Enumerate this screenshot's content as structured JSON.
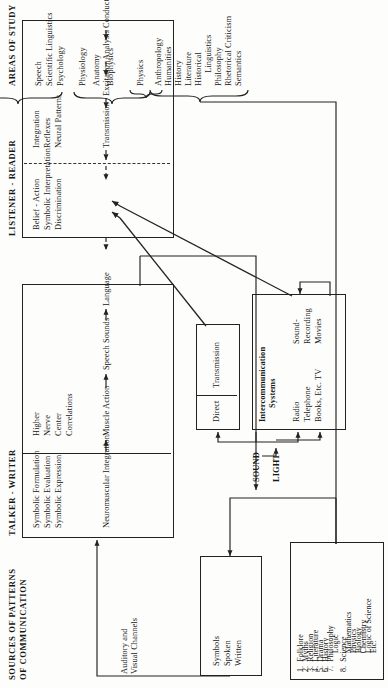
{
  "figure": {
    "sources_title_line1": "SOURCES OF PATTERNS",
    "sources_title_line2": "OF COMMUNICATION",
    "talker_title": "TALKER - WRITER",
    "listener_title": "LISTENER - READER",
    "areas_title": "AREAS OF STUDY"
  },
  "sources": {
    "channels_line1": "Auditory and",
    "channels_line2": "Visual Channels",
    "symbols_box": [
      "Symbols",
      "Spoken",
      "Written"
    ],
    "patterns_list": [
      "1.  Folklore",
      "2.  Myths",
      "3.  Religion",
      "4.  Literature",
      "5.  Drama",
      "6.  History",
      "7.  Philosophy",
      "         Logic",
      "8.  Science",
      "         Mathematics",
      "         Physics",
      "         Biology",
      "         Chemistry",
      "         Logic of Science",
      "         Etc."
    ]
  },
  "talker": {
    "col1": [
      "Symbolic Formulation",
      "Symbolic Evaluation",
      "Symbolic Expression"
    ],
    "col2": [
      "Higher",
      "Nerve",
      "Center",
      "Correlations"
    ],
    "stage1": "Neuromuscular Integration",
    "stage2": "Muscle Action",
    "stage3": "Speech Sounds",
    "stage4": "Language"
  },
  "channels": {
    "sound_label": "SOUND",
    "light_label": "LIGHT",
    "direct_box": [
      "Direct",
      "Transmission"
    ],
    "intercom_title_l1": "Intercommunication",
    "intercom_title_l2": "Systems",
    "intercom_col1": [
      "Radio",
      "Telephone",
      "Books, Etc. TV"
    ],
    "intercom_col2": [
      "Sound-",
      "Recording",
      "Movies"
    ]
  },
  "listener": {
    "col1": [
      "Belief - Action",
      "Symbolic Interpretation",
      "Discrimination"
    ],
    "col2": [
      "Integration",
      "Reflexes",
      "Neural Patterns"
    ],
    "stage1": "Transmission",
    "stage2": "Excitation",
    "stage3": "Analysis",
    "stage4": "Conduction"
  },
  "areas": {
    "group_a": [
      "Speech",
      "Scientific Linguistics",
      "Psychology"
    ],
    "group_b": [
      "Physiology",
      "Anatomy",
      "Biophysics"
    ],
    "group_c": [
      "Physics"
    ],
    "group_d": [
      "Anthropology",
      "Humanities",
      "History",
      "Literature",
      "Historical",
      "      Linguistics",
      "Philosophy",
      "Rhetorical Criticism",
      "Semantics"
    ]
  },
  "colors": {
    "ink": "#171717",
    "paper": "#fdfdfb",
    "faint": "#8d8d8d"
  }
}
